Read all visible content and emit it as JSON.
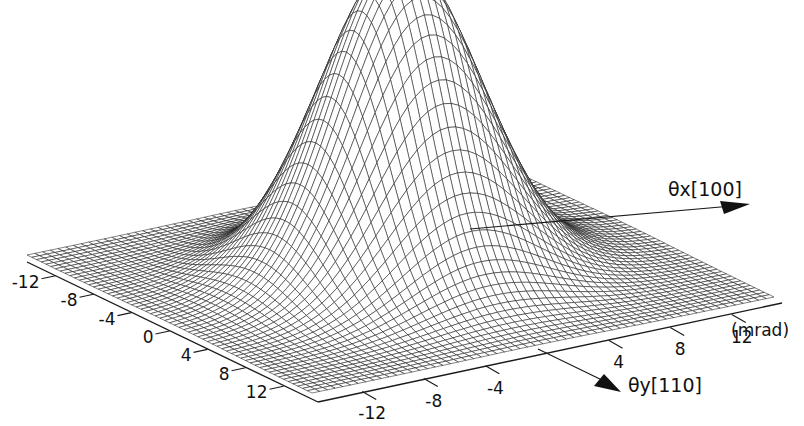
{
  "figure": {
    "background": "#ffffff",
    "ink": "#1a1a1a"
  },
  "chart_data": {
    "type": "surface",
    "title": "",
    "x_axis": {
      "label": "θx[100]",
      "ticks": [
        -12,
        -8,
        -4,
        0,
        4,
        8,
        12
      ],
      "tick_labels": [
        "-12",
        "-8",
        "-4",
        "0",
        "4",
        "8",
        "12"
      ],
      "range": [
        -15,
        15
      ]
    },
    "y_axis": {
      "label": "θy[110]",
      "ticks": [
        -12,
        -8,
        -4,
        4,
        8,
        12
      ],
      "tick_labels": [
        "-12",
        "-8",
        "-4",
        "4",
        "8",
        "12"
      ],
      "unit_label": "(mrad)",
      "range": [
        -15,
        15
      ]
    },
    "surface": {
      "shape": "single central Gaussian peak",
      "peak_center": [
        0,
        0
      ],
      "peak_height_relative": 1.0,
      "width_sigma_mrad": 4.5,
      "grid_lines": 60
    }
  }
}
